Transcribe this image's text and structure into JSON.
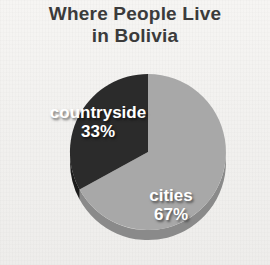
{
  "title": {
    "line1": "Where People Live",
    "line2": "in Bolivia"
  },
  "colors": {
    "background": "#f2f1ef",
    "title_text": "#3b3b3b",
    "cities_slice": "#a8a8a8",
    "cities_slice_rim": "#8a8a8a",
    "countryside_slice": "#2b2b2b",
    "countryside_slice_rim": "#1a1a1a",
    "label_text": "#ffffff"
  },
  "labels": {
    "countryside": {
      "name": "countryside",
      "percent": "33%"
    },
    "cities": {
      "name": "cities",
      "percent": "67%"
    }
  },
  "chart_data": {
    "type": "pie",
    "title": "Where People Live in Bolivia",
    "subtitle": "",
    "xlabel": "",
    "ylabel": "",
    "categories": [
      "cities",
      "countryside"
    ],
    "values": [
      67,
      33
    ],
    "value_unit": "%",
    "data_labels": [
      "cities 67%",
      "countryside 33%"
    ],
    "slice_colors": [
      "#a8a8a8",
      "#2b2b2b"
    ],
    "start_angle_deg": 0,
    "direction": "clockwise",
    "legend": "none",
    "grid": false,
    "three_d": true
  }
}
